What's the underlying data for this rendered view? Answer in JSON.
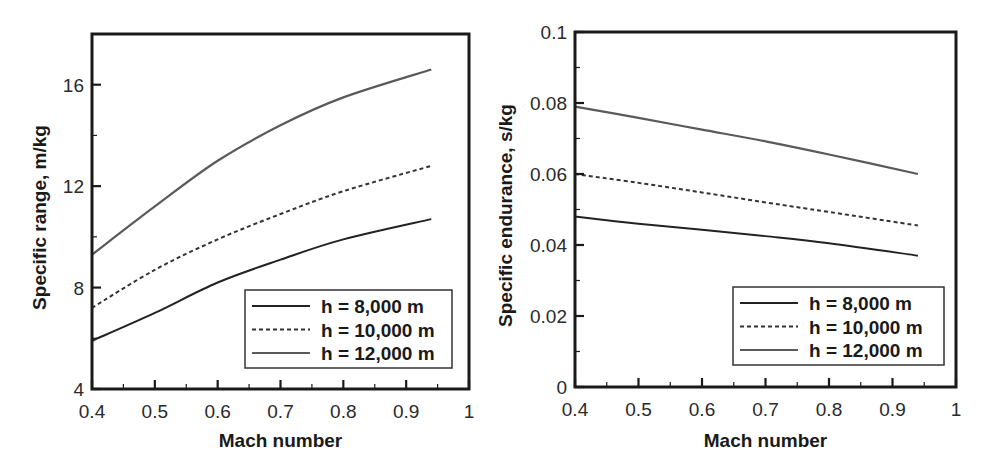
{
  "chart_data": [
    {
      "type": "line",
      "title": "",
      "xlabel": "Mach number",
      "ylabel": "Specific range, m/kg",
      "xlim": [
        0.4,
        1.0
      ],
      "ylim": [
        4,
        18
      ],
      "xticks": [
        "0.4",
        "0.5",
        "0.6",
        "0.7",
        "0.8",
        "0.9",
        "1"
      ],
      "yticks": [
        "4",
        "8",
        "12",
        "16"
      ],
      "grid": false,
      "legend_position": "lower right",
      "x": [
        0.4,
        0.5,
        0.6,
        0.7,
        0.8,
        0.94
      ],
      "series": [
        {
          "name": "h = 8,000 m",
          "style": "solid",
          "values": [
            5.9,
            7.0,
            8.2,
            9.1,
            9.9,
            10.7
          ]
        },
        {
          "name": "h = 10,000 m",
          "style": "dashed",
          "values": [
            7.2,
            8.7,
            9.9,
            10.9,
            11.8,
            12.8
          ]
        },
        {
          "name": "h = 12,000 m",
          "style": "solid-gray",
          "values": [
            9.3,
            11.2,
            13.0,
            14.4,
            15.5,
            16.6
          ]
        }
      ]
    },
    {
      "type": "line",
      "title": "",
      "xlabel": "Mach number",
      "ylabel": "Specific endurance, s/kg",
      "xlim": [
        0.4,
        1.0
      ],
      "ylim": [
        0,
        0.1
      ],
      "xticks": [
        "0.4",
        "0.5",
        "0.6",
        "0.7",
        "0.8",
        "0.9",
        "1"
      ],
      "yticks": [
        "0",
        "0.02",
        "0.04",
        "0.06",
        "0.08",
        "0.1"
      ],
      "grid": false,
      "legend_position": "lower right",
      "x": [
        0.4,
        0.5,
        0.6,
        0.7,
        0.8,
        0.94
      ],
      "series": [
        {
          "name": "h = 8,000 m",
          "style": "solid",
          "values": [
            0.048,
            0.046,
            0.0443,
            0.0425,
            0.0405,
            0.037
          ]
        },
        {
          "name": "h = 10,000 m",
          "style": "dashed",
          "values": [
            0.06,
            0.0575,
            0.0548,
            0.052,
            0.0493,
            0.0455
          ]
        },
        {
          "name": "h = 12,000 m",
          "style": "solid-gray",
          "values": [
            0.079,
            0.0758,
            0.0725,
            0.0692,
            0.0655,
            0.06
          ]
        }
      ]
    }
  ],
  "colors": {
    "axis": "#1a1a1a",
    "series_8000": "#2a2a2a",
    "series_10000": "#3a3a3a",
    "series_12000": "#555555"
  }
}
